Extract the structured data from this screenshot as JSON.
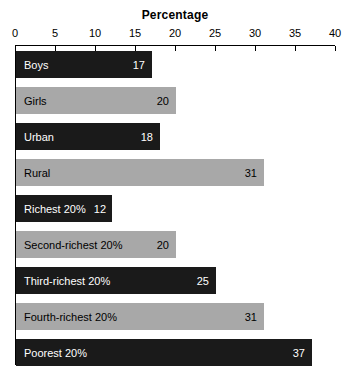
{
  "chart_data": {
    "type": "bar",
    "orientation": "horizontal",
    "title": "Percentage",
    "xlabel": "",
    "ylabel": "",
    "xlim": [
      0,
      40
    ],
    "xticks": [
      0,
      5,
      10,
      15,
      20,
      25,
      30,
      35,
      40
    ],
    "grid": false,
    "legend": "none",
    "categories": [
      "Boys",
      "Girls",
      "Urban",
      "Rural",
      "Richest 20%",
      "Second-richest 20%",
      "Third-richest 20%",
      "Fourth-richest 20%",
      "Poorest 20%"
    ],
    "values": [
      17,
      20,
      18,
      31,
      12,
      20,
      25,
      31,
      37
    ],
    "bars": [
      {
        "label": "Boys",
        "value": 17,
        "value_text": "17",
        "style": "dark"
      },
      {
        "label": "Girls",
        "value": 20,
        "value_text": "20",
        "style": "light"
      },
      {
        "label": "Urban",
        "value": 18,
        "value_text": "18",
        "style": "dark"
      },
      {
        "label": "Rural",
        "value": 31,
        "value_text": "31",
        "style": "light"
      },
      {
        "label": "Richest 20%",
        "value": 12,
        "value_text": "12",
        "style": "dark"
      },
      {
        "label": "Second-richest 20%",
        "value": 20,
        "value_text": "20",
        "style": "light"
      },
      {
        "label": "Third-richest 20%",
        "value": 25,
        "value_text": "25",
        "style": "dark"
      },
      {
        "label": "Fourth-richest 20%",
        "value": 31,
        "value_text": "31",
        "style": "light"
      },
      {
        "label": "Poorest 20%",
        "value": 37,
        "value_text": "37",
        "style": "dark"
      }
    ],
    "colors": {
      "dark_bar": "#1a1a1a",
      "light_bar": "#a8a8a8",
      "axis": "#000000",
      "background": "#ffffff",
      "dark_bar_text": "#ffffff",
      "light_bar_text": "#000000"
    }
  }
}
